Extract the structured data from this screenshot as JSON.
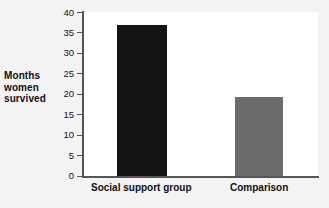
{
  "chart_data": {
    "type": "bar",
    "title": "",
    "subtitle": "",
    "xlabel": "",
    "ylabel": "Months women survived",
    "ylabel_lines": [
      "Months",
      "women",
      "survived"
    ],
    "categories": [
      "Social support group",
      "Comparison"
    ],
    "values": [
      37,
      19.4
    ],
    "series": [
      {
        "name": "Months women survived",
        "values": [
          37,
          19.4
        ]
      }
    ],
    "ylim": [
      0,
      40
    ],
    "yticks": [
      0,
      5,
      10,
      15,
      20,
      25,
      30,
      35,
      40
    ],
    "ytick_labels": [
      "0",
      "5",
      "10",
      "15",
      "20",
      "25",
      "30",
      "35",
      "40"
    ],
    "grid": false,
    "legend": false,
    "legend_position": "none",
    "bar_colors": [
      "#141414",
      "#6b6b6b"
    ],
    "plot_background": "#ffffff",
    "figure_background": "#f3f3f3",
    "axis_color": "#555555",
    "text_color": "#111111"
  }
}
